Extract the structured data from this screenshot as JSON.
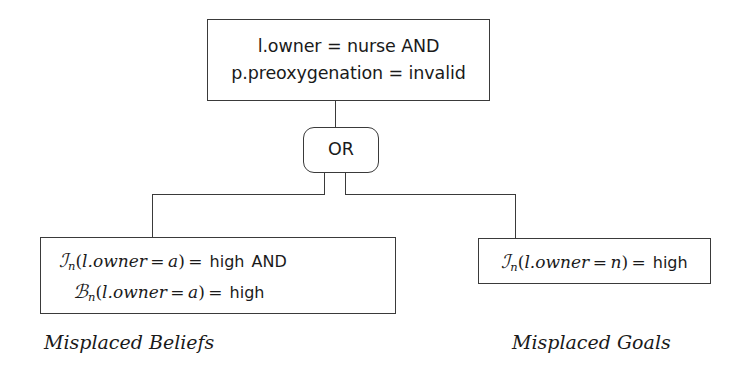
{
  "diagram": {
    "colors": {
      "stroke": "#3a3a3a",
      "text": "#1a1a1a",
      "background": "#ffffff"
    },
    "root_node": {
      "name": "root-condition-box",
      "lines": [
        "l.owner = nurse AND",
        "p.preoxygenation = invalid"
      ]
    },
    "gate": {
      "name": "or-gate",
      "label": "OR",
      "type": "OR"
    },
    "children": [
      {
        "name": "misplaced-beliefs-node",
        "caption": "Misplaced Beliefs",
        "expressions": [
          {
            "symbol": "I",
            "subscript": "n",
            "argument": "(l.owner = a)",
            "relation": "=",
            "value": "high",
            "connective": "AND",
            "plain": "I_n(l.owner = a) = high  AND"
          },
          {
            "symbol": "B",
            "subscript": "n",
            "argument": "(l.owner = a)",
            "relation": "=",
            "value": "high",
            "connective": "",
            "plain": "B_n(l.owner = a) = high"
          }
        ]
      },
      {
        "name": "misplaced-goals-node",
        "caption": "Misplaced Goals",
        "expressions": [
          {
            "symbol": "I",
            "subscript": "n",
            "argument": "(l.owner = n)",
            "relation": "=",
            "value": "high",
            "connective": "",
            "plain": "I_n(l.owner = n) = high"
          }
        ]
      }
    ],
    "tokens": {
      "scriptI": "ℐ",
      "scriptB": "ℬ",
      "subscript_n": "n",
      "paren_open": "(",
      "paren_close": ")",
      "lowner": "l.owner",
      "equals": "=",
      "var_a": "a",
      "var_n": "n",
      "high": "high",
      "and": "AND"
    }
  }
}
